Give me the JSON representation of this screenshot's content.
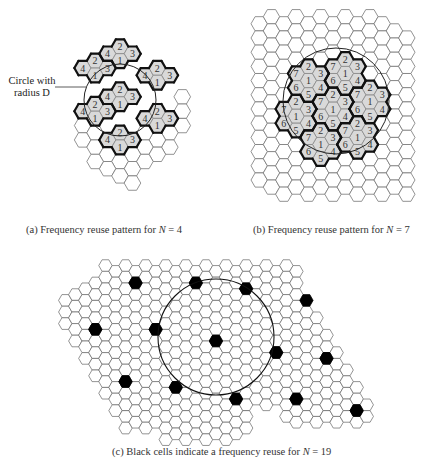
{
  "figure": {
    "panels": [
      {
        "id": "a",
        "caption_prefix": "(a)  Frequency reuse pattern for ",
        "caption_var": "N",
        "caption_suffix": " = 4",
        "N": 4,
        "callout": {
          "line1": "Circle with",
          "line2": "radius D"
        },
        "hex_radius": 8.3,
        "origin": [
          120,
          104
        ],
        "circle": {
          "cx": 120,
          "cy": 100,
          "r": 36
        },
        "shaded_cells": [
          {
            "q": 0,
            "r": -4,
            "label": "2"
          },
          {
            "q": -1,
            "r": -3,
            "label": "4"
          },
          {
            "q": 1,
            "r": -4,
            "label": "3"
          },
          {
            "q": 0,
            "r": -3,
            "label": "1"
          },
          {
            "q": -2,
            "r": -2,
            "label": "2"
          },
          {
            "q": -3,
            "r": -1,
            "label": "4"
          },
          {
            "q": -1,
            "r": -2,
            "label": "3"
          },
          {
            "q": -2,
            "r": -1,
            "label": "1"
          },
          {
            "q": 2,
            "r": -3,
            "label": "4"
          },
          {
            "q": 3,
            "r": -4,
            "label": "2"
          },
          {
            "q": 4,
            "r": -4,
            "label": "3"
          },
          {
            "q": 3,
            "r": -3,
            "label": "1"
          },
          {
            "q": 0,
            "r": -1,
            "label": "2"
          },
          {
            "q": -1,
            "r": 0,
            "label": "4"
          },
          {
            "q": 1,
            "r": -1,
            "label": "3"
          },
          {
            "q": 0,
            "r": 0,
            "label": "1"
          },
          {
            "q": -2,
            "r": 1,
            "label": "2"
          },
          {
            "q": -3,
            "r": 2,
            "label": "4"
          },
          {
            "q": -1,
            "r": 1,
            "label": "3"
          },
          {
            "q": -2,
            "r": 2,
            "label": "1"
          },
          {
            "q": 2,
            "r": 0,
            "label": "4"
          },
          {
            "q": 3,
            "r": -1,
            "label": "2"
          },
          {
            "q": 4,
            "r": -1,
            "label": "3"
          },
          {
            "q": 3,
            "r": 0,
            "label": "1"
          },
          {
            "q": 0,
            "r": 2,
            "label": "2"
          },
          {
            "q": -1,
            "r": 3,
            "label": "4"
          },
          {
            "q": 1,
            "r": 2,
            "label": "3"
          },
          {
            "q": 0,
            "r": 3,
            "label": "1"
          }
        ],
        "plain_cells": [
          {
            "q": 5,
            "r": -3
          },
          {
            "q": 5,
            "r": -2
          },
          {
            "q": 5,
            "r": -1
          },
          {
            "q": 4,
            "r": 0
          },
          {
            "q": 4,
            "r": 1
          },
          {
            "q": 3,
            "r": 1
          },
          {
            "q": 2,
            "r": 1
          },
          {
            "q": 2,
            "r": 2
          },
          {
            "q": 1,
            "r": 3
          },
          {
            "q": 3,
            "r": 2
          },
          {
            "q": -3,
            "r": 3
          },
          {
            "q": -3,
            "r": 4
          },
          {
            "q": -2,
            "r": 3
          },
          {
            "q": -2,
            "r": 4
          },
          {
            "q": -1,
            "r": 4
          },
          {
            "q": 0,
            "r": 4
          },
          {
            "q": 1,
            "r": 4
          },
          {
            "q": 2,
            "r": 3
          },
          {
            "q": -1,
            "r": 5
          },
          {
            "q": 0,
            "r": 5
          },
          {
            "q": -2,
            "r": 5
          },
          {
            "q": 1,
            "r": 5
          }
        ]
      },
      {
        "id": "b",
        "caption_prefix": "(b)  Frequency reuse pattern for ",
        "caption_var": "N",
        "caption_suffix": " = 7",
        "N": 7,
        "hex_radius": 8.2,
        "origin": [
          333,
          109
        ],
        "circle": {
          "cx": 336,
          "cy": 101,
          "r": 53
        },
        "shaded_cells": [
          {
            "q": 0,
            "r": 0,
            "label": "1"
          },
          {
            "q": 0,
            "r": -1,
            "label": "2"
          },
          {
            "q": 1,
            "r": -1,
            "label": "3"
          },
          {
            "q": 1,
            "r": 0,
            "label": "4"
          },
          {
            "q": 0,
            "r": 1,
            "label": "5"
          },
          {
            "q": -1,
            "r": 1,
            "label": "6"
          },
          {
            "q": -1,
            "r": 0,
            "label": "7"
          },
          {
            "q": 1,
            "r": -3,
            "label": "1"
          },
          {
            "q": 1,
            "r": -4,
            "label": "2"
          },
          {
            "q": 2,
            "r": -4,
            "label": "3"
          },
          {
            "q": 2,
            "r": -3,
            "label": "4"
          },
          {
            "q": 1,
            "r": -2,
            "label": "5"
          },
          {
            "q": 0,
            "r": -2,
            "label": "6"
          },
          {
            "q": 0,
            "r": -3,
            "label": "7"
          },
          {
            "q": 3,
            "r": -2,
            "label": "1"
          },
          {
            "q": 3,
            "r": -3,
            "label": "2"
          },
          {
            "q": 4,
            "r": -3,
            "label": "3"
          },
          {
            "q": 4,
            "r": -2,
            "label": "4"
          },
          {
            "q": 3,
            "r": -1,
            "label": "5"
          },
          {
            "q": 2,
            "r": -1,
            "label": "6"
          },
          {
            "q": 2,
            "r": -2,
            "label": "7"
          },
          {
            "q": 2,
            "r": 1,
            "label": "1"
          },
          {
            "q": 2,
            "r": 0,
            "label": "2"
          },
          {
            "q": 3,
            "r": 0,
            "label": "3"
          },
          {
            "q": 3,
            "r": 1,
            "label": "4"
          },
          {
            "q": 2,
            "r": 2,
            "label": "5"
          },
          {
            "q": 1,
            "r": 2,
            "label": "6"
          },
          {
            "q": 1,
            "r": 1,
            "label": "7"
          },
          {
            "q": -1,
            "r": 3,
            "label": "1"
          },
          {
            "q": -1,
            "r": 2,
            "label": "2"
          },
          {
            "q": 0,
            "r": 2,
            "label": "3"
          },
          {
            "q": 0,
            "r": 3,
            "label": "4"
          },
          {
            "q": -1,
            "r": 4,
            "label": "5"
          },
          {
            "q": -2,
            "r": 4,
            "label": "6"
          },
          {
            "q": -2,
            "r": 3,
            "label": "7"
          },
          {
            "q": -3,
            "r": 2,
            "label": "1"
          },
          {
            "q": -3,
            "r": 1,
            "label": "2"
          },
          {
            "q": -2,
            "r": 1,
            "label": "3"
          },
          {
            "q": -2,
            "r": 2,
            "label": "4"
          },
          {
            "q": -3,
            "r": 3,
            "label": "5"
          },
          {
            "q": -4,
            "r": 3,
            "label": "6"
          },
          {
            "q": -4,
            "r": 2,
            "label": "7"
          },
          {
            "q": -2,
            "r": -1,
            "label": "1"
          },
          {
            "q": -2,
            "r": -2,
            "label": "2"
          },
          {
            "q": -1,
            "r": -2,
            "label": "3"
          },
          {
            "q": -1,
            "r": -1,
            "label": "4"
          },
          {
            "q": -2,
            "r": 0,
            "label": "5"
          },
          {
            "q": -3,
            "r": 0,
            "label": "6"
          },
          {
            "q": -3,
            "r": -1,
            "label": "7"
          }
        ],
        "plain_range": {
          "qmin": -6,
          "qmax": 6,
          "rows": [
            -5,
            5
          ]
        }
      },
      {
        "id": "c",
        "caption_prefix": "(c) Black cells indicate a frequency reuse for ",
        "caption_var": "N",
        "caption_suffix": " = 19",
        "N": 19,
        "hex_radius": 6.7,
        "circle": {
          "cx": 216,
          "cy": 337,
          "r": 58
        },
        "black_cells_px": [
          [
            133,
            279
          ],
          [
            191,
            283
          ],
          [
            248,
            291
          ],
          [
            99,
            327
          ],
          [
            157,
            333
          ],
          [
            216,
            341
          ],
          [
            274,
            348
          ],
          [
            307,
            302
          ],
          [
            121,
            382
          ],
          [
            180,
            389
          ],
          [
            239,
            396
          ],
          [
            330,
            354
          ],
          [
            297,
            402
          ],
          [
            356,
            409
          ]
        ]
      }
    ]
  }
}
